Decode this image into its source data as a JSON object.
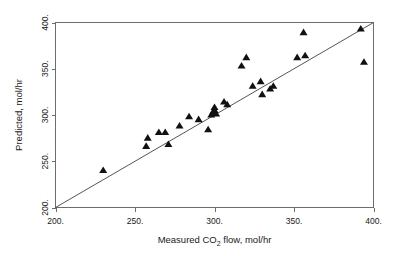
{
  "chart_data": {
    "type": "scatter",
    "title": "",
    "xlabel": "Measured CO2 flow, mol/hr",
    "xlabel_pre": "Measured CO",
    "xlabel_sub": "2",
    "xlabel_post": " flow, mol/hr",
    "ylabel": "Predicted, mol/hr",
    "xlim": [
      200,
      400
    ],
    "ylim": [
      200,
      400
    ],
    "xticks": [
      200,
      250,
      300,
      350,
      400
    ],
    "yticks": [
      200,
      250,
      300,
      350,
      400
    ],
    "xtick_labels": [
      "200.",
      "250.",
      "300.",
      "350.",
      "400."
    ],
    "ytick_labels": [
      "200.",
      "250.",
      "300.",
      "350.",
      "400."
    ],
    "grid": false,
    "legend": "none",
    "marker": "triangle",
    "marker_color": "#111111",
    "reference_line": {
      "label": "y = x",
      "from": [
        200,
        200
      ],
      "to": [
        400,
        400
      ],
      "color": "#555555"
    },
    "points": [
      {
        "x": 230,
        "y": 240
      },
      {
        "x": 257,
        "y": 266
      },
      {
        "x": 258,
        "y": 275
      },
      {
        "x": 265,
        "y": 281
      },
      {
        "x": 269,
        "y": 281
      },
      {
        "x": 271,
        "y": 268
      },
      {
        "x": 278,
        "y": 288
      },
      {
        "x": 284,
        "y": 298
      },
      {
        "x": 290,
        "y": 295
      },
      {
        "x": 296,
        "y": 284
      },
      {
        "x": 298,
        "y": 300
      },
      {
        "x": 299,
        "y": 303
      },
      {
        "x": 300,
        "y": 308
      },
      {
        "x": 300,
        "y": 305
      },
      {
        "x": 301,
        "y": 301
      },
      {
        "x": 306,
        "y": 314
      },
      {
        "x": 308,
        "y": 311
      },
      {
        "x": 317,
        "y": 353
      },
      {
        "x": 320,
        "y": 362
      },
      {
        "x": 324,
        "y": 331
      },
      {
        "x": 329,
        "y": 336
      },
      {
        "x": 330,
        "y": 322
      },
      {
        "x": 335,
        "y": 328
      },
      {
        "x": 337,
        "y": 331
      },
      {
        "x": 352,
        "y": 362
      },
      {
        "x": 356,
        "y": 389
      },
      {
        "x": 357,
        "y": 364
      },
      {
        "x": 392,
        "y": 393
      },
      {
        "x": 394,
        "y": 357
      }
    ]
  }
}
